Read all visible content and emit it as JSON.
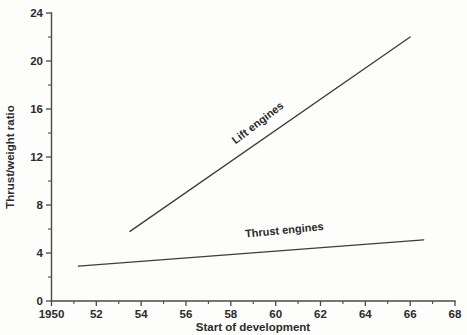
{
  "chart_data": {
    "type": "line",
    "title": "",
    "subtitle": "",
    "xlabel": "Start of development",
    "ylabel": "Thrust/weight ratio",
    "xlim": [
      1950,
      1968
    ],
    "ylim": [
      0,
      24
    ],
    "grid": false,
    "legend_position": "inline-annotations",
    "x_major_ticks": [
      1950,
      1952,
      1954,
      1956,
      1958,
      1960,
      1962,
      1964,
      1966,
      1968
    ],
    "x_tick_labels": [
      "1950",
      "52",
      "54",
      "56",
      "58",
      "60",
      "62",
      "64",
      "66",
      "68"
    ],
    "x_minor_ticks": [
      1951,
      1953,
      1955,
      1957,
      1959,
      1961,
      1963,
      1965,
      1967
    ],
    "y_major_ticks": [
      0,
      4,
      8,
      12,
      16,
      20,
      24
    ],
    "y_tick_labels": [
      "0",
      "4",
      "8",
      "12",
      "16",
      "20",
      "24"
    ],
    "y_minor_ticks": [
      2,
      6,
      10,
      14,
      18,
      22
    ],
    "series": [
      {
        "name": "Lift engines",
        "label": "Lift engines",
        "x": [
          1953.5,
          1966.0
        ],
        "values": [
          5.8,
          22.0
        ],
        "label_x": 1959.3,
        "label_y": 14.6,
        "label_rotation": -37.5
      },
      {
        "name": "Thrust engines",
        "label": "Thrust engines",
        "x": [
          1951.2,
          1966.6
        ],
        "values": [
          2.9,
          5.1
        ],
        "label_x": 1960.4,
        "label_y": 5.6,
        "label_rotation": -5.5
      }
    ]
  },
  "colors": {
    "line": "#3d3d3d",
    "axis": "#4a4a4a",
    "text": "#2b2b2b",
    "background": "#fdfdfc"
  }
}
